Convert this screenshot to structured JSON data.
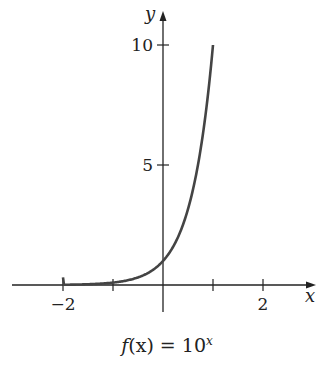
{
  "chart_data": {
    "type": "line",
    "function": "10^x",
    "xlabel": "x",
    "ylabel": "y",
    "xlim": [
      -3,
      3
    ],
    "ylim": [
      -1,
      11
    ],
    "x_ticks": [
      -2,
      -1,
      0,
      1,
      2
    ],
    "x_tick_labels": [
      "-2",
      "2"
    ],
    "y_ticks": [
      5,
      10
    ],
    "y_tick_labels": [
      "5",
      "10"
    ],
    "grid": false,
    "legend": null,
    "series": [
      {
        "name": "f(x) = 10^x",
        "x": [
          -2,
          -1.5,
          -1,
          -0.5,
          0,
          0.25,
          0.5,
          0.75,
          0.9,
          1
        ],
        "y": [
          0.01,
          0.032,
          0.1,
          0.316,
          1,
          1.778,
          3.162,
          5.623,
          7.943,
          10
        ]
      }
    ],
    "domain_plotted": [
      -2,
      1
    ]
  },
  "labels": {
    "x_axis": "x",
    "y_axis": "y",
    "tick_neg2": "−2",
    "tick_2": "2",
    "tick_5": "5",
    "tick_10": "10"
  },
  "caption": {
    "func": "f",
    "arg": "(x)",
    "eq": " = 10",
    "exp": "x"
  },
  "colors": {
    "axis": "#222222",
    "curve": "#444444"
  }
}
